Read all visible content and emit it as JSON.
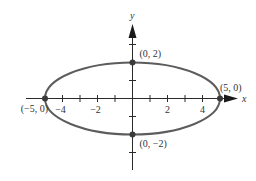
{
  "figure": {
    "type": "ellipse-graph",
    "equation_semi_axes": {
      "a": 5,
      "b": 2
    },
    "axes": {
      "x_label": "x",
      "y_label": "y",
      "x_ticks": [
        -4,
        -3,
        -2,
        -1,
        1,
        2,
        3,
        4
      ],
      "x_tick_labels": [
        {
          "value": -4,
          "text": "−4"
        },
        {
          "value": -2,
          "text": "−2"
        },
        {
          "value": 2,
          "text": "2"
        },
        {
          "value": 4,
          "text": "4"
        }
      ],
      "y_ticks": [
        -3,
        -1,
        1,
        3
      ]
    },
    "points": [
      {
        "x": 0,
        "y": 2,
        "label": "(0, 2)"
      },
      {
        "x": 0,
        "y": -2,
        "label": "(0, −2)"
      },
      {
        "x": 5,
        "y": 0,
        "label": "(5, 0)"
      },
      {
        "x": -5,
        "y": 0,
        "label": "(−5, 0)"
      }
    ],
    "colors": {
      "curve": "#5c5c5c",
      "axis": "#2a2a2a",
      "point": "#3a3a3a",
      "text": "#333333"
    }
  }
}
